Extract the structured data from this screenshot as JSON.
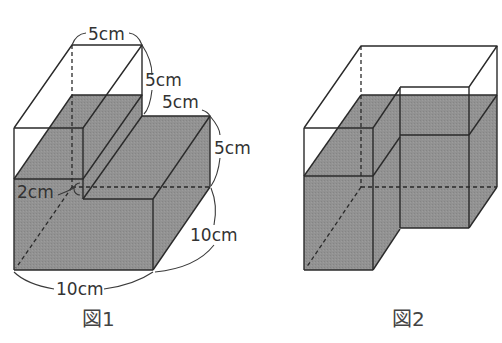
{
  "colors": {
    "water": "#8f8f8f",
    "edge": "#2a2a2a",
    "background": "#ffffff"
  },
  "figure1": {
    "caption": "図1",
    "labels": {
      "top_width": "5cm",
      "upper_height": "5cm",
      "step_width": "5cm",
      "step_height": "5cm",
      "hole_depth": "2cm",
      "depth": "10cm",
      "width": "10cm"
    }
  },
  "figure2": {
    "caption": "図2"
  }
}
